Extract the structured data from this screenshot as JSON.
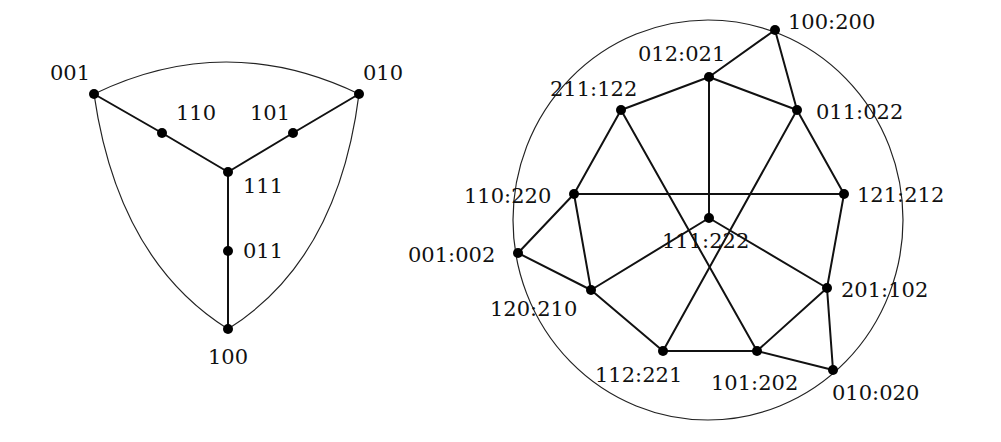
{
  "colors": {
    "background": "#ffffff",
    "ink": "#111111"
  },
  "left_graph": {
    "nodes": [
      {
        "id": "001",
        "label": "001",
        "x": 94,
        "y": 94,
        "lx": 50,
        "ly": 80,
        "anchor": "start"
      },
      {
        "id": "010",
        "label": "010",
        "x": 359,
        "y": 94,
        "lx": 363,
        "ly": 80,
        "anchor": "start"
      },
      {
        "id": "110",
        "label": "110",
        "x": 162,
        "y": 133,
        "lx": 176,
        "ly": 120,
        "anchor": "start"
      },
      {
        "id": "101",
        "label": "101",
        "x": 293,
        "y": 133,
        "lx": 250,
        "ly": 120,
        "anchor": "start"
      },
      {
        "id": "111",
        "label": "111",
        "x": 228,
        "y": 172,
        "lx": 243,
        "ly": 193,
        "anchor": "start"
      },
      {
        "id": "011",
        "label": "011",
        "x": 228,
        "y": 251,
        "lx": 243,
        "ly": 258,
        "anchor": "start"
      },
      {
        "id": "100",
        "label": "100",
        "x": 228,
        "y": 329,
        "lx": 208,
        "ly": 364,
        "anchor": "start"
      }
    ],
    "edges": [
      [
        "001",
        "110"
      ],
      [
        "110",
        "111"
      ],
      [
        "010",
        "101"
      ],
      [
        "101",
        "111"
      ],
      [
        "111",
        "011"
      ],
      [
        "011",
        "100"
      ]
    ],
    "arcs": [
      {
        "from": "001",
        "to": "010",
        "path": "M94,94 Q226,30 359,94"
      },
      {
        "from": "001",
        "to": "100",
        "path": "M94,94 Q118,260 228,329"
      },
      {
        "from": "010",
        "to": "100",
        "path": "M359,94 Q338,260 228,329"
      }
    ]
  },
  "right_graph": {
    "outer_circle": {
      "cx": 708,
      "cy": 220,
      "rx": 195,
      "ry": 200
    },
    "nodes": [
      {
        "id": "100:200",
        "label": "100:200",
        "x": 775,
        "y": 30,
        "lx": 788,
        "ly": 29,
        "anchor": "start"
      },
      {
        "id": "012:021",
        "label": "012:021",
        "x": 709,
        "y": 77,
        "lx": 638,
        "ly": 61,
        "anchor": "start"
      },
      {
        "id": "211:122",
        "label": "211:122",
        "x": 621,
        "y": 110,
        "lx": 550,
        "ly": 96,
        "anchor": "start"
      },
      {
        "id": "011:022",
        "label": "011:022",
        "x": 797,
        "y": 110,
        "lx": 816,
        "ly": 119,
        "anchor": "start"
      },
      {
        "id": "110:220",
        "label": "110:220",
        "x": 574,
        "y": 194,
        "lx": 464,
        "ly": 203,
        "anchor": "start"
      },
      {
        "id": "121:212",
        "label": "121:212",
        "x": 844,
        "y": 194,
        "lx": 857,
        "ly": 202,
        "anchor": "start"
      },
      {
        "id": "111:222",
        "label": "111:222",
        "x": 709,
        "y": 218,
        "lx": 662,
        "ly": 248,
        "anchor": "start"
      },
      {
        "id": "001:002",
        "label": "001:002",
        "x": 518,
        "y": 253,
        "lx": 408,
        "ly": 262,
        "anchor": "start"
      },
      {
        "id": "120:210",
        "label": "120:210",
        "x": 591,
        "y": 290,
        "lx": 490,
        "ly": 316,
        "anchor": "start"
      },
      {
        "id": "201:102",
        "label": "201:102",
        "x": 827,
        "y": 288,
        "lx": 841,
        "ly": 297,
        "anchor": "start"
      },
      {
        "id": "112:221",
        "label": "112:221",
        "x": 663,
        "y": 351,
        "lx": 595,
        "ly": 382,
        "anchor": "start"
      },
      {
        "id": "101:202",
        "label": "101:202",
        "x": 757,
        "y": 351,
        "lx": 711,
        "ly": 390,
        "anchor": "start"
      },
      {
        "id": "010:020",
        "label": "010:020",
        "x": 833,
        "y": 370,
        "lx": 832,
        "ly": 400,
        "anchor": "start"
      }
    ],
    "edges": [
      [
        "100:200",
        "012:021"
      ],
      [
        "100:200",
        "011:022"
      ],
      [
        "012:021",
        "211:122"
      ],
      [
        "012:021",
        "011:022"
      ],
      [
        "012:021",
        "111:222"
      ],
      [
        "211:122",
        "110:220"
      ],
      [
        "211:122",
        "101:202"
      ],
      [
        "011:022",
        "121:212"
      ],
      [
        "011:022",
        "112:221"
      ],
      [
        "110:220",
        "121:212"
      ],
      [
        "110:220",
        "001:002"
      ],
      [
        "110:220",
        "120:210"
      ],
      [
        "121:212",
        "201:102"
      ],
      [
        "111:222",
        "120:210"
      ],
      [
        "111:222",
        "201:102"
      ],
      [
        "001:002",
        "120:210"
      ],
      [
        "120:210",
        "112:221"
      ],
      [
        "201:102",
        "101:202"
      ],
      [
        "201:102",
        "010:020"
      ],
      [
        "112:221",
        "101:202"
      ],
      [
        "101:202",
        "010:020"
      ]
    ]
  }
}
